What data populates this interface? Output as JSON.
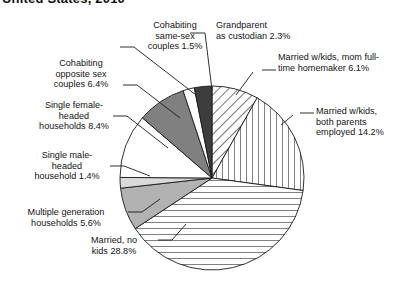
{
  "title": "United States, 2010",
  "chart_data": {
    "type": "pie",
    "title": "United States, 2010",
    "xlabel": "",
    "ylabel": "",
    "legend_position": "none",
    "grid": false,
    "start_angle_deg": 0,
    "direction": "clockwise",
    "center": [
      212,
      178
    ],
    "radius": 92,
    "categories": [
      "Married w/kids, mom full-time homemaker",
      "Married w/kids, both parents employed",
      "Married, no kids",
      "Multiple generation households",
      "Single male-headed household",
      "Single female-headed households",
      "Cohabiting opposite sex couples",
      "Cohabiting same-sex couples",
      "Grandparent as custodian"
    ],
    "values": [
      6.1,
      14.2,
      28.8,
      5.6,
      1.4,
      8.4,
      6.4,
      1.5,
      2.3
    ],
    "slices": [
      {
        "label": "Married w/kids, mom full-time homemaker 6.1%",
        "value": 6.1,
        "fill": "diagonal-hatch",
        "color": "#ffffff"
      },
      {
        "label": "Married w/kids, both parents employed 14.2%",
        "value": 14.2,
        "fill": "vertical-hatch",
        "color": "#ffffff"
      },
      {
        "label": "Married, no kids 28.8%",
        "value": 28.8,
        "fill": "horizontal-hatch",
        "color": "#ffffff"
      },
      {
        "label": "Multiple generation households 5.6%",
        "value": 5.6,
        "fill": "solid",
        "color": "#b2b2b2"
      },
      {
        "label": "Single male-headed household 1.4%",
        "value": 1.4,
        "fill": "solid",
        "color": "#d9d9d9"
      },
      {
        "label": "Single female-headed households 8.4%",
        "value": 8.4,
        "fill": "solid",
        "color": "#ffffff"
      },
      {
        "label": "Cohabiting opposite sex couples 6.4%",
        "value": 6.4,
        "fill": "solid",
        "color": "#808080"
      },
      {
        "label": "Cohabiting same-sex couples 1.5%",
        "value": 1.5,
        "fill": "solid",
        "color": "#ffffff"
      },
      {
        "label": "Grandparent as custodian 2.3%",
        "value": 2.3,
        "fill": "solid",
        "color": "#3d3d3d"
      }
    ]
  },
  "labels": {
    "grandparent": "Grandparent\nas custodian 2.3%",
    "mom_homemaker": "Married w/kids, mom full-\ntime homemaker 6.1%",
    "both_employed": "Married w/kids,\nboth parents\nemployed 14.2%",
    "cohabiting_same_sex": "Cohabiting\nsame-sex\ncouples 1.5%",
    "cohabiting_opposite_sex": "Cohabiting\nopposite sex\ncouples 6.4%",
    "single_female": "Single female-\nheaded\nhouseholds 8.4%",
    "single_male": "Single male-\nheaded\nhousehold 1.4%",
    "multiple_generation": "Multiple generation\nhouseholds 5.6%",
    "married_no_kids": "Married, no\nkids 28.8%"
  }
}
